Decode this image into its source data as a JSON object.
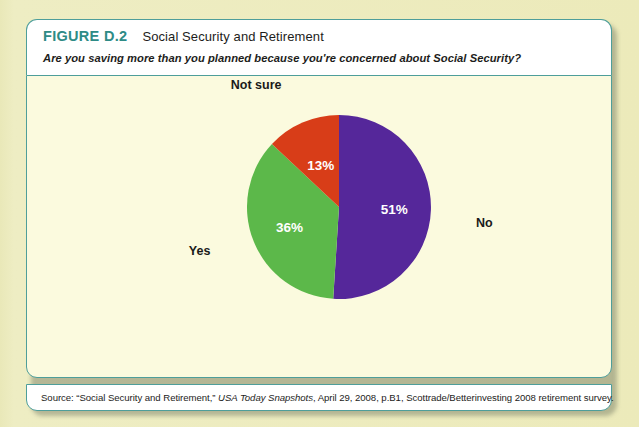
{
  "figure": {
    "number": "FIGURE D.2",
    "title": "Social Security and Retirement",
    "subtitle": "Are you saving more than you planned because you're concerned about Social Security?",
    "source_prefix": "Source: “Social Security and Retirement,” ",
    "source_italic": "USA Today Snapshots",
    "source_suffix": ", April 29, 2008, p.B1, Scottrade/Betterinvesting 2008 retirement survey.",
    "accent_color": "#2e8b86",
    "border_color": "#4e9e9a",
    "header_bg": "#ffffff",
    "body_bg": "#fbfade",
    "page_bg": "#ecebbe"
  },
  "chart_data": {
    "type": "pie",
    "title": "Social Security and Retirement",
    "subtitle": "Are you saving more than you planned because you're concerned about Social Security?",
    "categories": [
      "No",
      "Yes",
      "Not sure"
    ],
    "values": [
      51,
      36,
      13
    ],
    "value_labels": [
      "51%",
      "36%",
      "13%"
    ],
    "colors": [
      "#55279a",
      "#5cb84a",
      "#d83d18"
    ],
    "start_angle_deg": 0,
    "direction": "clockwise",
    "legend": "none",
    "labels_position": "inside-and-outside",
    "slices": [
      {
        "label": "No",
        "value": 51,
        "value_label": "51%",
        "color": "#55279a"
      },
      {
        "label": "Yes",
        "value": 36,
        "value_label": "36%",
        "color": "#5cb84a"
      },
      {
        "label": "Not sure",
        "value": 13,
        "value_label": "13%",
        "color": "#d83d18"
      }
    ]
  }
}
